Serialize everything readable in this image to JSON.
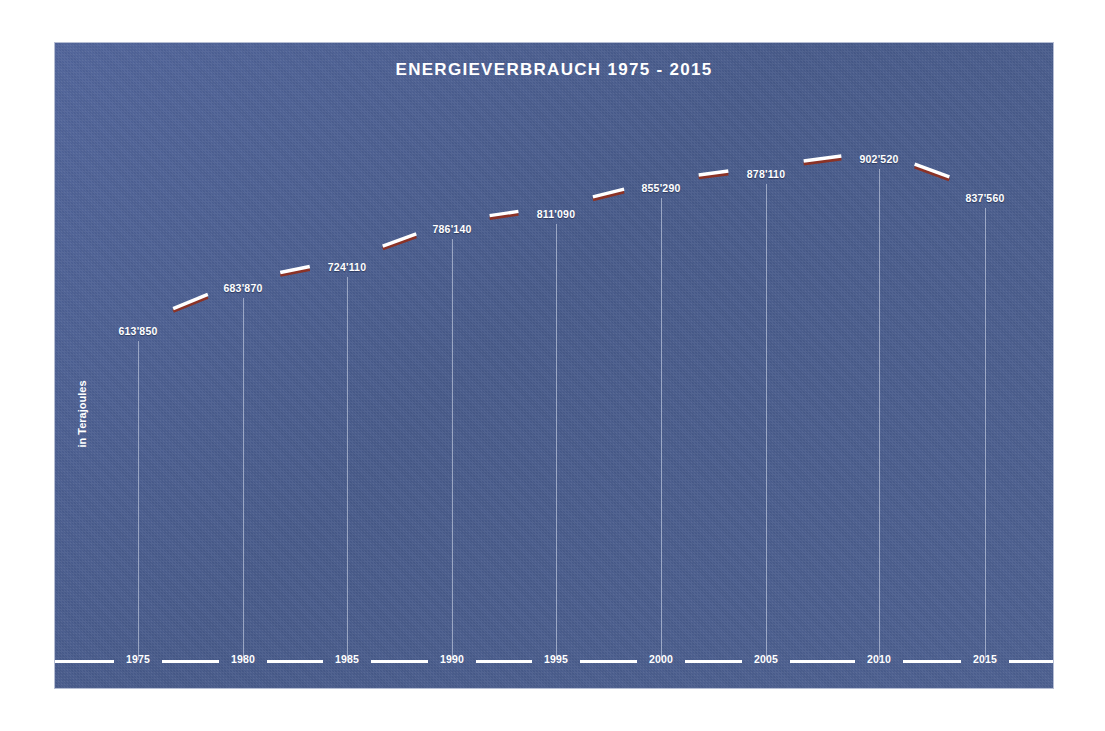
{
  "chart_data": {
    "type": "line",
    "title": "ENERGIEVERBRAUCH 1975 - 2015",
    "xlabel": "",
    "ylabel": "in Terajoules",
    "categories": [
      "1975",
      "1980",
      "1985",
      "1990",
      "1995",
      "2000",
      "2005",
      "2010",
      "2015"
    ],
    "values": [
      613850,
      683870,
      724110,
      786140,
      811090,
      855290,
      878110,
      902520,
      837560
    ],
    "value_labels": [
      "613'850",
      "683'870",
      "724'110",
      "786'140",
      "811'090",
      "855'290",
      "878'110",
      "902'520",
      "837'560"
    ],
    "ylim": [
      0,
      960000
    ],
    "grid": false,
    "legend": null,
    "series": [
      {
        "name": "Energieverbrauch",
        "values": [
          613850,
          683870,
          724110,
          786140,
          811090,
          855290,
          878110,
          902520,
          837560
        ]
      }
    ]
  },
  "colors": {
    "panel_background": "#4b5e8e",
    "line_top": "#ffffff",
    "line_shadow": "#8b3226",
    "text": "#ffffff",
    "drop_line": "#e2e8f5",
    "page_background": "#ffffff"
  },
  "axis": {
    "x_tick_labels": [
      "1975",
      "1980",
      "1985",
      "1990",
      "1995",
      "2000",
      "2005",
      "2010",
      "2015"
    ],
    "y_caption": "in Terajoules"
  },
  "points": [
    {
      "year": "1975",
      "label": "613'850",
      "x": 83,
      "y": 280
    },
    {
      "year": "1980",
      "label": "683'870",
      "x": 188,
      "y": 237
    },
    {
      "year": "1985",
      "label": "724'110",
      "x": 292,
      "y": 216
    },
    {
      "year": "1990",
      "label": "786'140",
      "x": 397,
      "y": 178
    },
    {
      "year": "1995",
      "label": "811'090",
      "x": 501,
      "y": 163
    },
    {
      "year": "2000",
      "label": "855'290",
      "x": 606,
      "y": 137
    },
    {
      "year": "2005",
      "label": "878'110",
      "x": 711,
      "y": 123
    },
    {
      "year": "2010",
      "label": "902'520",
      "x": 824,
      "y": 108
    },
    {
      "year": "2015",
      "label": "837'560",
      "x": 930,
      "y": 147
    }
  ]
}
